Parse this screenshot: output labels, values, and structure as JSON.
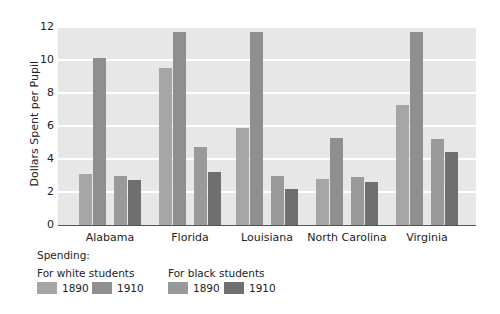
{
  "chart_data": {
    "type": "bar",
    "title": "",
    "xlabel": "",
    "ylabel": "Dollars Spent per Pupil",
    "ylim": [
      0,
      12
    ],
    "yticks": [
      0,
      2,
      4,
      6,
      8,
      10,
      12
    ],
    "grid": true,
    "categories": [
      "Alabama",
      "Florida",
      "Louisiana",
      "North Carolina",
      "Virginia"
    ],
    "series": [
      {
        "name": "For white students 1890",
        "color": "#a6a6a6",
        "values": [
          3.1,
          9.5,
          5.9,
          2.8,
          7.3
        ]
      },
      {
        "name": "For white students 1910",
        "color": "#8f8f8f",
        "values": [
          10.1,
          11.7,
          11.7,
          5.3,
          11.7
        ]
      },
      {
        "name": "For black students 1890",
        "color": "#9a9a9a",
        "values": [
          3.0,
          4.7,
          3.0,
          2.9,
          5.2
        ]
      },
      {
        "name": "For black students 1910",
        "color": "#6f6f6f",
        "values": [
          2.7,
          3.2,
          2.2,
          2.6,
          4.4
        ]
      }
    ],
    "legend_position": "bottom-left"
  },
  "axis": {
    "ylabel": "Dollars Spent per Pupil",
    "yticks": [
      "0",
      "2",
      "4",
      "6",
      "8",
      "10",
      "12"
    ],
    "categories": [
      "Alabama",
      "Florida",
      "Louisiana",
      "North Carolina",
      "Virginia"
    ]
  },
  "legend": {
    "title": "Spending:",
    "groups": [
      {
        "label": "For white students",
        "items": [
          {
            "label": "1890",
            "color": "#a6a6a6"
          },
          {
            "label": "1910",
            "color": "#8f8f8f"
          }
        ]
      },
      {
        "label": "For black students",
        "items": [
          {
            "label": "1890",
            "color": "#9a9a9a"
          },
          {
            "label": "1910",
            "color": "#6f6f6f"
          }
        ]
      }
    ]
  }
}
